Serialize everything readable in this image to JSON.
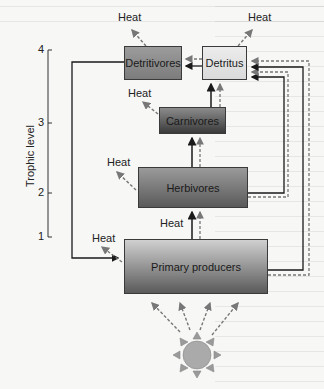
{
  "axis": {
    "title": "Trophic level",
    "ticks": [
      "4",
      "3",
      "2",
      "1"
    ]
  },
  "boxes": {
    "detritivores": "Detritivores",
    "detritus": "Detritus",
    "carnivores": "Carnivores",
    "herbivores": "Herbivores",
    "producers": "Primary producers"
  },
  "heat_labels": {
    "detritivores": "Heat",
    "detritus": "Heat",
    "carnivores": "Heat",
    "herbivores": "Heat",
    "herbivore_input": "Heat",
    "producers": "Heat"
  },
  "legend_semantics": {
    "solid_arrow": "nutrient/matter flow",
    "dashed_arrow": "energy flow"
  },
  "colors": {
    "solid_arrow": "#1a1a1a",
    "dashed_arrow": "#777777",
    "sun_fill": "#9a9a9a"
  }
}
